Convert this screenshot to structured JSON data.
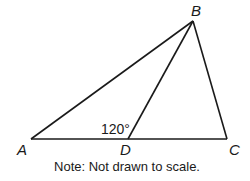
{
  "diagram": {
    "points": {
      "A": {
        "label": "A",
        "x": 31,
        "y": 139
      },
      "B": {
        "label": "B",
        "x": 193,
        "y": 21
      },
      "C": {
        "label": "C",
        "x": 227,
        "y": 139
      },
      "D": {
        "label": "D",
        "x": 128,
        "y": 139
      }
    },
    "segments": [
      "AB",
      "BC",
      "AC",
      "BD"
    ],
    "angle_label": "120°",
    "angle_at": "BDA",
    "note": "Note: Not drawn to scale.",
    "line_color": "#1a1a1a"
  }
}
